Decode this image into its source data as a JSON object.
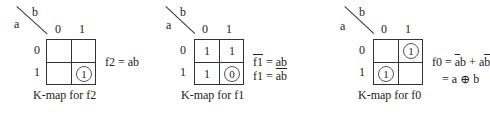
{
  "kmaps": [
    {
      "row_var": "a",
      "col_var": "b",
      "col_headers": [
        "0",
        "1"
      ],
      "row_headers": [
        "0",
        "1"
      ],
      "cells": [
        [
          "",
          ""
        ],
        [
          "",
          "1"
        ]
      ],
      "circled": [
        [
          false,
          false
        ],
        [
          false,
          true
        ]
      ],
      "caption": "K-map for f2",
      "equations": [
        {
          "lhs": "f2",
          "eq": " = ",
          "rhs": "ab"
        }
      ]
    },
    {
      "row_var": "a",
      "col_var": "b",
      "col_headers": [
        "0",
        "1"
      ],
      "row_headers": [
        "0",
        "1"
      ],
      "cells": [
        [
          "1",
          "1"
        ],
        [
          "1",
          "0"
        ]
      ],
      "circled": [
        [
          false,
          false
        ],
        [
          false,
          true
        ]
      ],
      "caption": "K-map for f1",
      "equations": [
        {
          "lhs": "f1",
          "lhs_bar": true,
          "eq": " = ",
          "rhs": "ab"
        },
        {
          "lhs": "f1",
          "eq": " = ",
          "rhs": "ab",
          "rhs_bar": true
        }
      ]
    },
    {
      "row_var": "a",
      "col_var": "b",
      "col_headers": [
        "0",
        "1"
      ],
      "row_headers": [
        "0",
        "1"
      ],
      "cells": [
        [
          "",
          "1"
        ],
        [
          "1",
          ""
        ]
      ],
      "circled": [
        [
          false,
          true
        ],
        [
          true,
          false
        ]
      ],
      "caption": "K-map for f0",
      "equations": [
        {
          "lhs": "f0",
          "eq": " = ",
          "term1_a": "a",
          "term1_b": "b",
          "plus": " + ",
          "term2_a": "a",
          "term2_b": "b"
        },
        {
          "eq": "= ",
          "rhs": "a ⊕ b"
        }
      ]
    }
  ]
}
